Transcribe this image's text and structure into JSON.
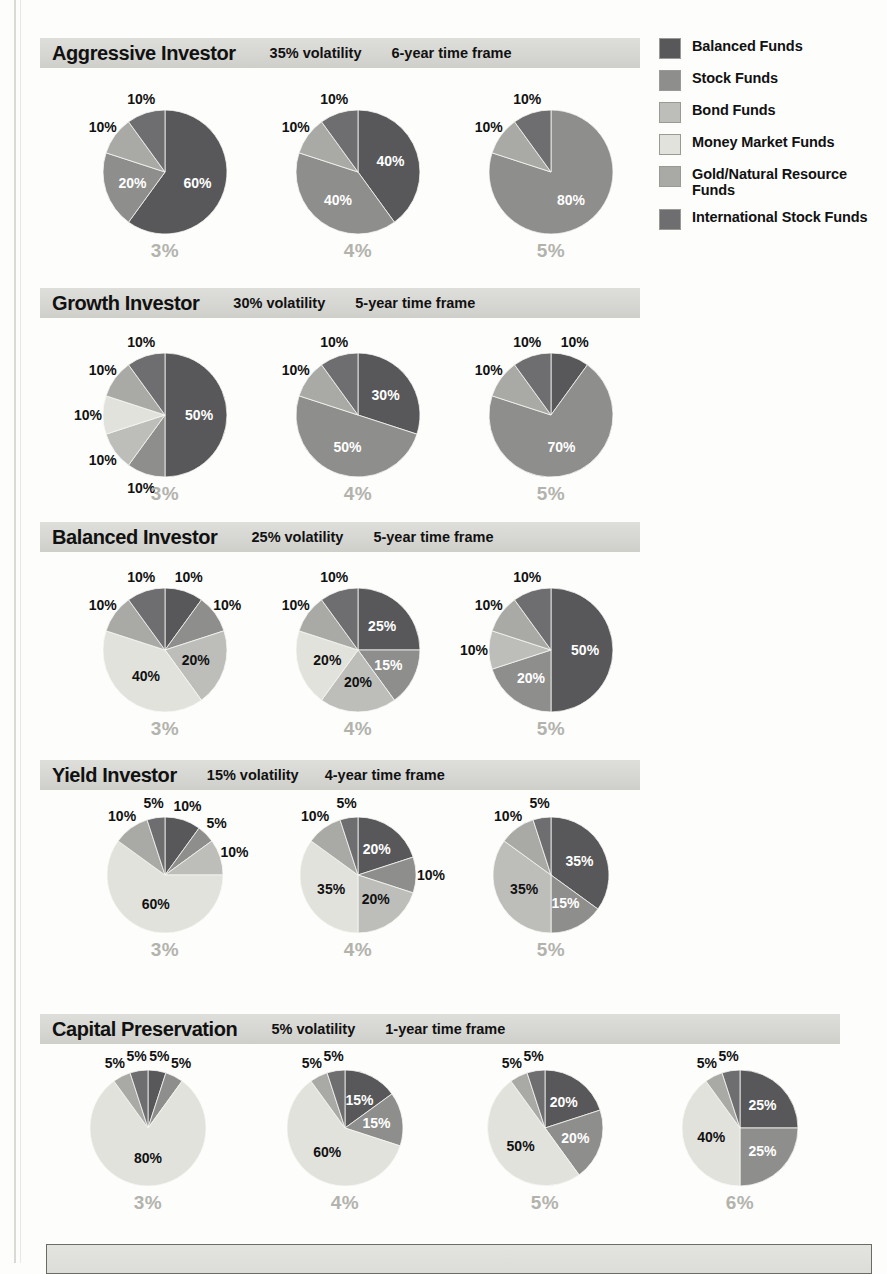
{
  "legend": {
    "items": [
      {
        "label": "Balanced Funds",
        "color": "#58585a",
        "key": "balanced"
      },
      {
        "label": "Stock Funds",
        "color": "#8e8e8c",
        "key": "stock"
      },
      {
        "label": "Bond Funds",
        "color": "#bdbdba",
        "key": "bond"
      },
      {
        "label": "Money Market Funds",
        "color": "#e2e2dd",
        "key": "money"
      },
      {
        "label": "Gold/Natural Resource Funds",
        "color": "#a9a9a5",
        "key": "gold"
      },
      {
        "label": "International Stock Funds",
        "color": "#6e6e70",
        "key": "intl"
      }
    ]
  },
  "chart_data": {
    "type": "pie",
    "legend_position": "right",
    "series_labels": [
      "Balanced Funds",
      "Stock Funds",
      "Bond Funds",
      "Money Market Funds",
      "Gold/Natural Resource Funds",
      "International Stock Funds"
    ],
    "sections": [
      {
        "name": "Aggressive Investor",
        "volatility": "35% volatility",
        "time_frame": "6-year time frame",
        "pies": [
          {
            "caption": "3%",
            "slices": [
              {
                "label": "60%",
                "value": 60,
                "key": "balanced"
              },
              {
                "label": "20%",
                "value": 20,
                "key": "stock"
              },
              {
                "label": "10%",
                "value": 10,
                "key": "gold"
              },
              {
                "label": "10%",
                "value": 10,
                "key": "intl"
              }
            ]
          },
          {
            "caption": "4%",
            "slices": [
              {
                "label": "40%",
                "value": 40,
                "key": "balanced"
              },
              {
                "label": "40%",
                "value": 40,
                "key": "stock"
              },
              {
                "label": "10%",
                "value": 10,
                "key": "gold"
              },
              {
                "label": "10%",
                "value": 10,
                "key": "intl"
              }
            ]
          },
          {
            "caption": "5%",
            "slices": [
              {
                "label": "80%",
                "value": 80,
                "key": "stock"
              },
              {
                "label": "10%",
                "value": 10,
                "key": "gold"
              },
              {
                "label": "10%",
                "value": 10,
                "key": "intl"
              }
            ]
          }
        ]
      },
      {
        "name": "Growth Investor",
        "volatility": "30% volatility",
        "time_frame": "5-year time frame",
        "pies": [
          {
            "caption": "3%",
            "slices": [
              {
                "label": "50%",
                "value": 50,
                "key": "balanced"
              },
              {
                "label": "10%",
                "value": 10,
                "key": "stock"
              },
              {
                "label": "10%",
                "value": 10,
                "key": "bond"
              },
              {
                "label": "10%",
                "value": 10,
                "key": "money"
              },
              {
                "label": "10%",
                "value": 10,
                "key": "gold"
              },
              {
                "label": "10%",
                "value": 10,
                "key": "intl"
              }
            ]
          },
          {
            "caption": "4%",
            "slices": [
              {
                "label": "30%",
                "value": 30,
                "key": "balanced"
              },
              {
                "label": "50%",
                "value": 50,
                "key": "stock"
              },
              {
                "label": "10%",
                "value": 10,
                "key": "gold"
              },
              {
                "label": "10%",
                "value": 10,
                "key": "intl"
              }
            ]
          },
          {
            "caption": "5%",
            "slices": [
              {
                "label": "10%",
                "value": 10,
                "key": "balanced"
              },
              {
                "label": "70%",
                "value": 70,
                "key": "stock"
              },
              {
                "label": "10%",
                "value": 10,
                "key": "gold"
              },
              {
                "label": "10%",
                "value": 10,
                "key": "intl"
              }
            ]
          }
        ]
      },
      {
        "name": "Balanced Investor",
        "volatility": "25% volatility",
        "time_frame": "5-year time frame",
        "pies": [
          {
            "caption": "3%",
            "slices": [
              {
                "label": "10%",
                "value": 10,
                "key": "balanced"
              },
              {
                "label": "10%",
                "value": 10,
                "key": "stock"
              },
              {
                "label": "20%",
                "value": 20,
                "key": "bond"
              },
              {
                "label": "40%",
                "value": 40,
                "key": "money"
              },
              {
                "label": "10%",
                "value": 10,
                "key": "gold"
              },
              {
                "label": "10%",
                "value": 10,
                "key": "intl"
              }
            ]
          },
          {
            "caption": "4%",
            "slices": [
              {
                "label": "25%",
                "value": 25,
                "key": "balanced"
              },
              {
                "label": "15%",
                "value": 15,
                "key": "stock"
              },
              {
                "label": "20%",
                "value": 20,
                "key": "bond"
              },
              {
                "label": "20%",
                "value": 20,
                "key": "money"
              },
              {
                "label": "10%",
                "value": 10,
                "key": "gold"
              },
              {
                "label": "10%",
                "value": 10,
                "key": "intl"
              }
            ]
          },
          {
            "caption": "5%",
            "slices": [
              {
                "label": "50%",
                "value": 50,
                "key": "balanced"
              },
              {
                "label": "20%",
                "value": 20,
                "key": "stock"
              },
              {
                "label": "10%",
                "value": 10,
                "key": "bond"
              },
              {
                "label": "10%",
                "value": 10,
                "key": "gold"
              },
              {
                "label": "10%",
                "value": 10,
                "key": "intl"
              }
            ]
          }
        ]
      },
      {
        "name": "Yield Investor",
        "volatility": "15% volatility",
        "time_frame": "4-year time frame",
        "pies": [
          {
            "caption": "3%",
            "slices": [
              {
                "label": "10%",
                "value": 10,
                "key": "balanced"
              },
              {
                "label": "5%",
                "value": 5,
                "key": "stock"
              },
              {
                "label": "10%",
                "value": 10,
                "key": "bond"
              },
              {
                "label": "60%",
                "value": 60,
                "key": "money"
              },
              {
                "label": "10%",
                "value": 10,
                "key": "gold"
              },
              {
                "label": "5%",
                "value": 5,
                "key": "intl"
              }
            ]
          },
          {
            "caption": "4%",
            "slices": [
              {
                "label": "20%",
                "value": 20,
                "key": "balanced"
              },
              {
                "label": "10%",
                "value": 10,
                "key": "stock"
              },
              {
                "label": "20%",
                "value": 20,
                "key": "bond"
              },
              {
                "label": "35%",
                "value": 35,
                "key": "money"
              },
              {
                "label": "10%",
                "value": 10,
                "key": "gold"
              },
              {
                "label": "5%",
                "value": 5,
                "key": "intl"
              }
            ]
          },
          {
            "caption": "5%",
            "slices": [
              {
                "label": "35%",
                "value": 35,
                "key": "balanced"
              },
              {
                "label": "15%",
                "value": 15,
                "key": "stock"
              },
              {
                "label": "35%",
                "value": 35,
                "key": "bond"
              },
              {
                "label": "10%",
                "value": 10,
                "key": "gold"
              },
              {
                "label": "5%",
                "value": 5,
                "key": "intl"
              }
            ]
          }
        ]
      },
      {
        "name": "Capital Preservation",
        "volatility": "5% volatility",
        "time_frame": "1-year time frame",
        "pies": [
          {
            "caption": "3%",
            "slices": [
              {
                "label": "5%",
                "value": 5,
                "key": "balanced"
              },
              {
                "label": "5%",
                "value": 5,
                "key": "stock"
              },
              {
                "label": "80%",
                "value": 80,
                "key": "money"
              },
              {
                "label": "5%",
                "value": 5,
                "key": "gold"
              },
              {
                "label": "5%",
                "value": 5,
                "key": "intl"
              }
            ]
          },
          {
            "caption": "4%",
            "slices": [
              {
                "label": "15%",
                "value": 15,
                "key": "balanced"
              },
              {
                "label": "15%",
                "value": 15,
                "key": "stock"
              },
              {
                "label": "60%",
                "value": 60,
                "key": "money"
              },
              {
                "label": "5%",
                "value": 5,
                "key": "gold"
              },
              {
                "label": "5%",
                "value": 5,
                "key": "intl"
              }
            ]
          },
          {
            "caption": "5%",
            "slices": [
              {
                "label": "20%",
                "value": 20,
                "key": "balanced"
              },
              {
                "label": "20%",
                "value": 20,
                "key": "stock"
              },
              {
                "label": "50%",
                "value": 50,
                "key": "money"
              },
              {
                "label": "5%",
                "value": 5,
                "key": "gold"
              },
              {
                "label": "5%",
                "value": 5,
                "key": "intl"
              }
            ]
          },
          {
            "caption": "6%",
            "slices": [
              {
                "label": "25%",
                "value": 25,
                "key": "balanced"
              },
              {
                "label": "25%",
                "value": 25,
                "key": "stock"
              },
              {
                "label": "40%",
                "value": 40,
                "key": "money"
              },
              {
                "label": "5%",
                "value": 5,
                "key": "gold"
              },
              {
                "label": "5%",
                "value": 5,
                "key": "intl"
              }
            ]
          }
        ]
      }
    ]
  },
  "layout": {
    "sections": [
      {
        "top": 38,
        "band_left": 40,
        "band_width": 600,
        "title_gap": 34,
        "vol_gap": 30,
        "pies": [
          {
            "cx": 165,
            "cy": 172,
            "r": 62
          },
          {
            "cx": 358,
            "cy": 172,
            "r": 62
          },
          {
            "cx": 551,
            "cy": 172,
            "r": 62
          }
        ]
      },
      {
        "top": 288,
        "band_left": 40,
        "band_width": 600,
        "title_gap": 34,
        "vol_gap": 30,
        "pies": [
          {
            "cx": 165,
            "cy": 415,
            "r": 62
          },
          {
            "cx": 358,
            "cy": 415,
            "r": 62
          },
          {
            "cx": 551,
            "cy": 415,
            "r": 62
          }
        ]
      },
      {
        "top": 522,
        "band_left": 40,
        "band_width": 600,
        "title_gap": 34,
        "vol_gap": 30,
        "pies": [
          {
            "cx": 165,
            "cy": 650,
            "r": 62
          },
          {
            "cx": 358,
            "cy": 650,
            "r": 62
          },
          {
            "cx": 551,
            "cy": 650,
            "r": 62
          }
        ]
      },
      {
        "top": 760,
        "band_left": 40,
        "band_width": 600,
        "title_gap": 30,
        "vol_gap": 26,
        "pies": [
          {
            "cx": 165,
            "cy": 875,
            "r": 58
          },
          {
            "cx": 358,
            "cy": 875,
            "r": 58
          },
          {
            "cx": 551,
            "cy": 875,
            "r": 58
          }
        ]
      },
      {
        "top": 1014,
        "band_left": 40,
        "band_width": 800,
        "title_gap": 34,
        "vol_gap": 30,
        "pies": [
          {
            "cx": 148,
            "cy": 1128,
            "r": 58
          },
          {
            "cx": 345,
            "cy": 1128,
            "r": 58
          },
          {
            "cx": 545,
            "cy": 1128,
            "r": 58
          },
          {
            "cx": 740,
            "cy": 1128,
            "r": 58
          }
        ]
      }
    ]
  }
}
